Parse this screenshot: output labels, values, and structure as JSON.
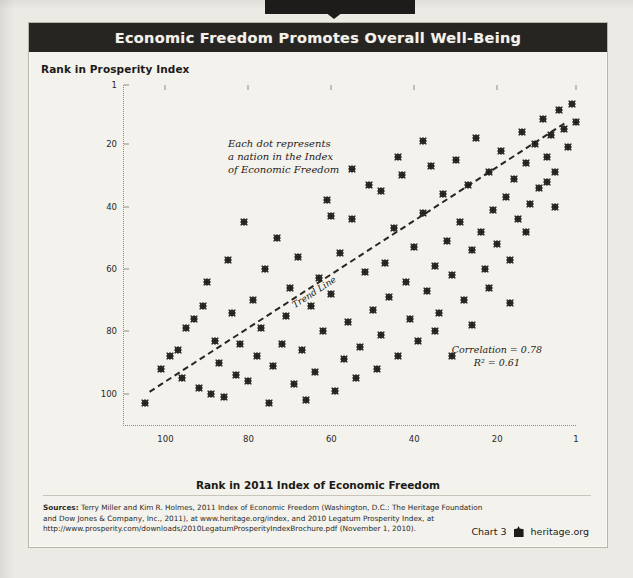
{
  "figure": {
    "title": "Economic Freedom Promotes Overall Well-Being",
    "chart_number": "Chart 3",
    "attribution": "heritage.org",
    "logo_icon": "heritage-building-icon"
  },
  "annotations": {
    "note_line1": "Each dot represents",
    "note_line2": "a nation in the Index",
    "note_line3": "of Economic Freedom",
    "trend_label": "Trend Line",
    "correlation": "Correlation = 0.78",
    "r_squared": "R² = 0.61"
  },
  "sources": {
    "label": "Sources:",
    "line1": " Terry Miller and Kim R. Holmes, 2011 Index of Economic Freedom (Washington, D.C.: The Heritage Foundation",
    "line2": "and Dow Jones & Company, Inc., 2011), at www.heritage.org/index, and 2010 Legatum Prosperity Index, at",
    "line3": "http://www.prosperity.com/downloads/2010LegatumProsperityIndexBrochure.pdf (November 1, 2010)."
  },
  "chart_data": {
    "type": "scatter",
    "title": "Economic Freedom Promotes Overall Well-Being",
    "xlabel": "Rank in 2011 Index of Economic Freedom",
    "ylabel": "Rank in Prosperity Index",
    "xticks": [
      100,
      80,
      60,
      40,
      20,
      1
    ],
    "yticks": [
      1,
      20,
      40,
      60,
      80,
      100
    ],
    "xlim": [
      110,
      1
    ],
    "ylim": [
      110,
      1
    ],
    "x_inverted": true,
    "y_inverted": true,
    "grid": false,
    "legend": null,
    "trend": {
      "label": "Trend Line",
      "style": "dashed",
      "x_start": 104,
      "y_start": 99,
      "x_end": 4,
      "y_end": 13,
      "correlation": 0.78,
      "r_squared": 0.61
    },
    "point_count": 110,
    "points": [
      [
        105,
        103
      ],
      [
        101,
        92
      ],
      [
        99,
        88
      ],
      [
        97,
        86
      ],
      [
        96,
        95
      ],
      [
        95,
        79
      ],
      [
        93,
        76
      ],
      [
        92,
        98
      ],
      [
        91,
        72
      ],
      [
        90,
        64
      ],
      [
        89,
        100
      ],
      [
        88,
        83
      ],
      [
        87,
        90
      ],
      [
        86,
        101
      ],
      [
        85,
        57
      ],
      [
        84,
        74
      ],
      [
        83,
        94
      ],
      [
        82,
        84
      ],
      [
        81,
        45
      ],
      [
        80,
        96
      ],
      [
        79,
        70
      ],
      [
        78,
        88
      ],
      [
        77,
        79
      ],
      [
        76,
        60
      ],
      [
        75,
        103
      ],
      [
        74,
        91
      ],
      [
        73,
        50
      ],
      [
        72,
        84
      ],
      [
        71,
        75
      ],
      [
        70,
        66
      ],
      [
        69,
        97
      ],
      [
        68,
        56
      ],
      [
        67,
        86
      ],
      [
        66,
        102
      ],
      [
        65,
        72
      ],
      [
        64,
        93
      ],
      [
        63,
        63
      ],
      [
        62,
        80
      ],
      [
        61,
        38
      ],
      [
        60,
        68
      ],
      [
        59,
        99
      ],
      [
        58,
        55
      ],
      [
        57,
        89
      ],
      [
        56,
        77
      ],
      [
        55,
        44
      ],
      [
        54,
        95
      ],
      [
        53,
        85
      ],
      [
        52,
        61
      ],
      [
        51,
        33
      ],
      [
        50,
        73
      ],
      [
        49,
        92
      ],
      [
        48,
        81
      ],
      [
        47,
        58
      ],
      [
        46,
        69
      ],
      [
        45,
        47
      ],
      [
        44,
        88
      ],
      [
        43,
        30
      ],
      [
        42,
        64
      ],
      [
        41,
        76
      ],
      [
        40,
        53
      ],
      [
        39,
        83
      ],
      [
        38,
        42
      ],
      [
        37,
        67
      ],
      [
        36,
        27
      ],
      [
        35,
        59
      ],
      [
        34,
        74
      ],
      [
        33,
        36
      ],
      [
        32,
        51
      ],
      [
        31,
        62
      ],
      [
        30,
        25
      ],
      [
        29,
        45
      ],
      [
        28,
        70
      ],
      [
        27,
        33
      ],
      [
        26,
        54
      ],
      [
        25,
        18
      ],
      [
        24,
        48
      ],
      [
        23,
        60
      ],
      [
        22,
        29
      ],
      [
        21,
        41
      ],
      [
        20,
        52
      ],
      [
        19,
        22
      ],
      [
        18,
        37
      ],
      [
        17,
        57
      ],
      [
        16,
        31
      ],
      [
        15,
        44
      ],
      [
        14,
        16
      ],
      [
        13,
        26
      ],
      [
        12,
        39
      ],
      [
        11,
        20
      ],
      [
        10,
        34
      ],
      [
        9,
        12
      ],
      [
        8,
        24
      ],
      [
        7,
        17
      ],
      [
        6,
        29
      ],
      [
        5,
        9
      ],
      [
        4,
        15
      ],
      [
        3,
        21
      ],
      [
        2,
        7
      ],
      [
        1,
        13
      ],
      [
        48,
        35
      ],
      [
        44,
        24
      ],
      [
        38,
        19
      ],
      [
        60,
        43
      ],
      [
        55,
        28
      ],
      [
        35,
        80
      ],
      [
        31,
        88
      ],
      [
        26,
        78
      ],
      [
        22,
        66
      ],
      [
        17,
        71
      ],
      [
        13,
        48
      ],
      [
        8,
        32
      ],
      [
        6,
        40
      ]
    ]
  }
}
